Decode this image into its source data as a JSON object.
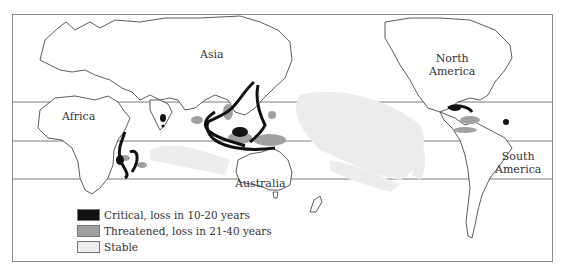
{
  "map": {
    "labels": {
      "asia": "Asia",
      "africa": "Africa",
      "australia": "Australia",
      "north_america_1": "North",
      "north_america_2": "America",
      "south_america_1": "South",
      "south_america_2": "America"
    },
    "legend": [
      {
        "label": "Critical, loss in 10-20 years",
        "color": "#111111"
      },
      {
        "label": "Threatened, loss in 21-40 years",
        "color": "#a0a0a0"
      },
      {
        "label": "Stable",
        "color": "#ececec"
      }
    ],
    "latitude_lines_y": [
      102,
      141,
      179
    ]
  }
}
